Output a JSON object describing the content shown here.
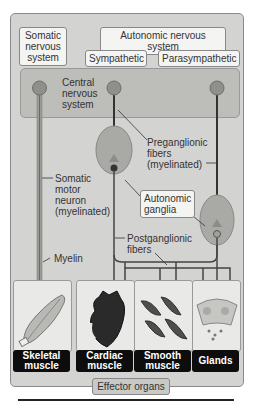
{
  "labels": {
    "somatic": "Somatic nervous system",
    "somatic_lines": [
      "Somatic",
      "nervous",
      "system"
    ],
    "autonomic": "Autonomic nervous system",
    "sympathetic": "Sympathetic",
    "parasympathetic": "Parasympathetic",
    "cns_lines": [
      "Central",
      "nervous",
      "system"
    ],
    "preganglionic_lines": [
      "Preganglionic",
      "fibers",
      "(myelinated)"
    ],
    "somatic_motor_lines": [
      "Somatic",
      "motor",
      "neuron",
      "(myelinated)"
    ],
    "autonomic_ganglia_lines": [
      "Autonomic",
      "ganglia"
    ],
    "postganglionic_lines": [
      "Postganglionic",
      "fibers"
    ],
    "myelin": "Myelin",
    "effector_organs": "Effector organs"
  },
  "organs": [
    {
      "name": "skeletal",
      "lines": [
        "Skeletal",
        "muscle"
      ]
    },
    {
      "name": "cardiac",
      "lines": [
        "Cardiac",
        "muscle"
      ]
    },
    {
      "name": "smooth",
      "lines": [
        "Smooth",
        "muscle"
      ]
    },
    {
      "name": "glands",
      "lines": [
        "Glands"
      ]
    }
  ],
  "colors": {
    "frame": "#d3d3d1",
    "cns": "#bdbdb9",
    "ganglion": "#a9a9a5",
    "neuron_body": "#8f8f8b",
    "organ_label_bg": "#0d0d0d"
  }
}
